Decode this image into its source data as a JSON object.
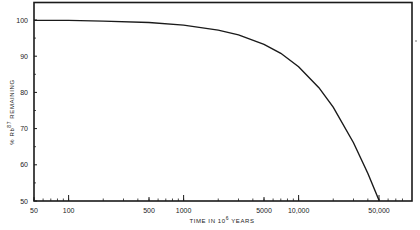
{
  "chart_data": {
    "type": "line",
    "title": "",
    "xlabel": "TIME IN 10^6 YEARS",
    "xlabel_parts": {
      "main": "TIME IN 10",
      "sup": "6",
      "tail": " YEARS"
    },
    "ylabel": "% Rb^87 REMAINING",
    "ylabel_parts": {
      "prefix": "% Rb",
      "sup": "87",
      "tail": " REMAINING"
    },
    "x_scale": "log",
    "xlim": [
      50,
      80000
    ],
    "ylim": [
      50,
      105
    ],
    "grid": false,
    "legend": null,
    "x_ticks": [
      {
        "value": 50,
        "label": "50"
      },
      {
        "value": 100,
        "label": "100"
      },
      {
        "value": 500,
        "label": "500"
      },
      {
        "value": 1000,
        "label": "1000"
      },
      {
        "value": 5000,
        "label": "5000"
      },
      {
        "value": 10000,
        "label": "10,000"
      },
      {
        "value": 50000,
        "label": "50,000"
      }
    ],
    "y_ticks": [
      {
        "value": 50,
        "label": "50"
      },
      {
        "value": 60,
        "label": "60"
      },
      {
        "value": 70,
        "label": "70"
      },
      {
        "value": 80,
        "label": "80"
      },
      {
        "value": 90,
        "label": "90"
      },
      {
        "value": 100,
        "label": "100"
      }
    ],
    "series": [
      {
        "name": "Rb-87 decay",
        "x": [
          50,
          100,
          200,
          500,
          1000,
          2000,
          3000,
          5000,
          7000,
          10000,
          15000,
          20000,
          30000,
          40000,
          50000,
          55000
        ],
        "y": [
          99.9,
          99.9,
          99.7,
          99.3,
          98.6,
          97.2,
          95.9,
          93.3,
          90.8,
          87.1,
          81.3,
          75.9,
          66.1,
          57.6,
          50.2,
          47.1
        ]
      }
    ],
    "line_color": "#1a1a1a"
  }
}
